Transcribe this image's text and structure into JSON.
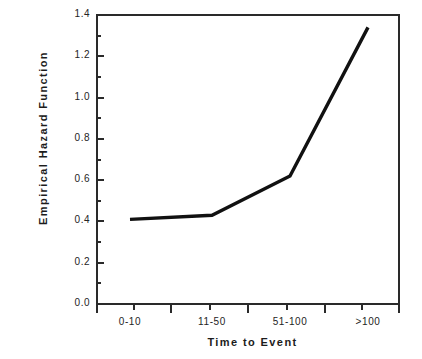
{
  "chart_data": {
    "type": "line",
    "title": "",
    "xlabel": "Time to Event",
    "ylabel": "Empirical Hazard Function",
    "categories": [
      "0-10",
      "11-50",
      "51-100",
      ">100"
    ],
    "values": [
      0.41,
      0.43,
      0.62,
      1.34
    ],
    "series": [
      {
        "name": "Empirical Hazard Function",
        "values": [
          0.41,
          0.43,
          0.62,
          1.34
        ]
      }
    ],
    "ylim": [
      0.0,
      1.4
    ],
    "ytick_labels": [
      "0.0",
      "0.2",
      "0.4",
      "0.6",
      "0.8",
      "1.0",
      "1.2",
      "1.4"
    ],
    "ytick_values": [
      0.0,
      0.2,
      0.4,
      0.6,
      0.8,
      1.0,
      1.2,
      1.4
    ],
    "yminor_values": [
      0.1,
      0.3,
      0.5,
      0.7,
      0.9,
      1.1,
      1.3
    ],
    "grid": false,
    "legend": "none",
    "line_color": "#111111",
    "frame_color": "#2a2a2a",
    "background": "#ffffff"
  },
  "axes": {
    "y_title": "Empirical  Hazard  Function",
    "x_title": "Time  to  Event"
  }
}
